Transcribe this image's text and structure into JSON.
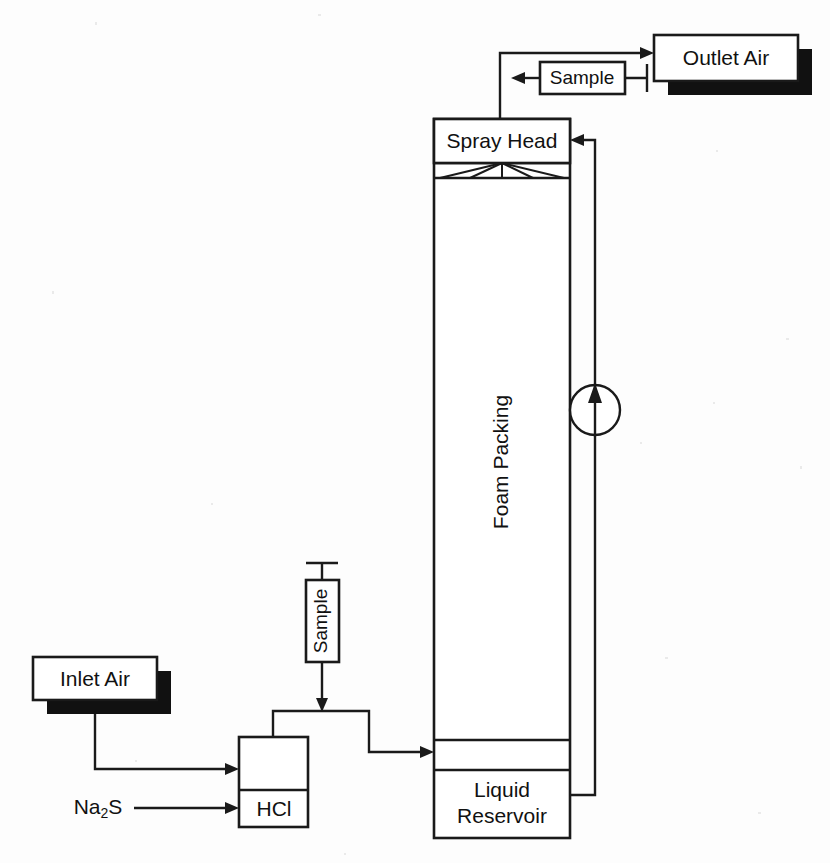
{
  "diagram": {
    "type": "process-flow",
    "background_color": "#fdfdfd",
    "line_color": "#1a1a1a",
    "shadow_color": "#111111",
    "nodes": {
      "outlet_air": {
        "label": "Outlet Air",
        "shape": "box-with-shadow"
      },
      "sample_top": {
        "label": "Sample",
        "shape": "box"
      },
      "spray_head": {
        "label": "Spray Head",
        "shape": "box"
      },
      "foam_packing": {
        "label": "Foam Packing",
        "shape": "column-section",
        "orientation": "vertical-text"
      },
      "liquid_reservoir": {
        "label": "Liquid Reservoir",
        "label_line_1": "Liquid",
        "label_line_2": "Reservoir",
        "shape": "box"
      },
      "inlet_air": {
        "label": "Inlet Air",
        "shape": "box-with-shadow"
      },
      "hcl": {
        "label": "HCl",
        "shape": "box"
      },
      "sample_mid": {
        "label": "Sample",
        "shape": "box",
        "orientation": "vertical-text"
      },
      "na2s": {
        "label_main": "Na",
        "label_sub": "2",
        "label_tail": "S",
        "shape": "text-label"
      },
      "pump": {
        "label": "",
        "shape": "circle-with-arrow",
        "icon": "pump-icon"
      }
    },
    "streams": [
      {
        "name": "column-to-outlet-air",
        "from": "spray_head",
        "to": "outlet_air"
      },
      {
        "name": "outlet-air-sample-tap",
        "from": "outlet_air",
        "to": "sample_top"
      },
      {
        "name": "sample-return-to-column",
        "from": "sample_top",
        "to": "spray_head"
      },
      {
        "name": "recycle-liquid",
        "from": "liquid_reservoir",
        "to": "spray_head",
        "has_pump": true
      },
      {
        "name": "inlet-air-to-hcl",
        "from": "inlet_air",
        "to": "hcl"
      },
      {
        "name": "na2s-to-hcl",
        "from": "na2s",
        "to": "hcl"
      },
      {
        "name": "hcl-gas-to-column",
        "from": "hcl",
        "to": "liquid_reservoir"
      },
      {
        "name": "gas-line-sample-tap",
        "from": "sample_mid",
        "to": "hcl-gas-to-column"
      }
    ]
  }
}
